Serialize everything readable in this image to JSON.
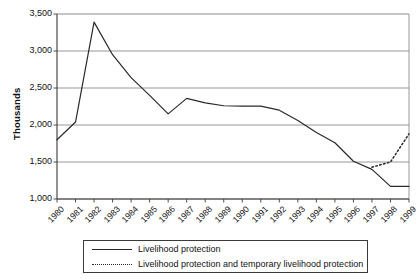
{
  "chart_data": {
    "type": "line",
    "title": "",
    "xlabel": "",
    "ylabel": "Thousands",
    "ylim": [
      1000,
      3500
    ],
    "ytick_step": 500,
    "ytick_labels": [
      "3,500",
      "3,000",
      "2,500",
      "2,000",
      "1,500",
      "1,000"
    ],
    "ytick_values": [
      3500,
      3000,
      2500,
      2000,
      1500,
      1000
    ],
    "grid": true,
    "grid_axis": "y",
    "legend_position": "bottom",
    "categories": [
      "1980",
      "1981",
      "1982",
      "1983",
      "1984",
      "1985",
      "1986",
      "1987",
      "1988",
      "1989",
      "1990",
      "1991",
      "1992",
      "1993",
      "1994",
      "1995",
      "1996",
      "1997",
      "1998",
      "1999"
    ],
    "x": [
      1980,
      1981,
      1982,
      1983,
      1984,
      1985,
      1986,
      1987,
      1988,
      1989,
      1990,
      1991,
      1992,
      1993,
      1994,
      1995,
      1996,
      1997,
      1998,
      1999
    ],
    "series": [
      {
        "name": "Livelihood protection",
        "style": "solid",
        "color": "#2a2a2a",
        "values": [
          1800,
          2040,
          3390,
          2950,
          2640,
          2400,
          2150,
          2360,
          2300,
          2260,
          2255,
          2255,
          2200,
          2060,
          1900,
          1760,
          1510,
          1400,
          1170,
          1170
        ]
      },
      {
        "name": "Livelihood protection and temporary livelihood protection",
        "style": "dotted",
        "color": "#2a2a2a",
        "values": [
          null,
          null,
          null,
          null,
          null,
          null,
          null,
          null,
          null,
          null,
          null,
          null,
          null,
          null,
          null,
          null,
          null,
          1430,
          1500,
          1880
        ]
      }
    ]
  },
  "legend": {
    "items": [
      {
        "label": "Livelihood protection",
        "style": "solid"
      },
      {
        "label": "Livelihood protection and temporary livelihood protection",
        "style": "dotted"
      }
    ]
  },
  "colors": {
    "line": "#2a2a2a",
    "grid": "#8c8c8c",
    "axis": "#3a3a3a",
    "text": "#111111",
    "background": "#ffffff"
  }
}
